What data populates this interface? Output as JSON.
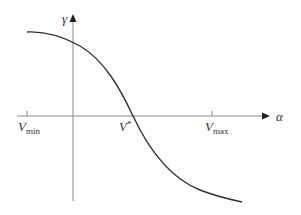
{
  "diagram": {
    "axes": {
      "x_label": "α",
      "y_label": "γ"
    },
    "ticks": [
      {
        "id": "vmin",
        "main": "V",
        "sub": "min"
      },
      {
        "id": "vstar",
        "main": "V",
        "sup": "*"
      },
      {
        "id": "vmax",
        "main": "V",
        "sub": "max"
      }
    ],
    "curve": {
      "description": "Decreasing S-shaped curve: flat near top-left, crosses horizontal axis at V*, decreasing toward bottom-right",
      "color": "#333333"
    },
    "colors": {
      "axis": "#888888",
      "curve": "#333333",
      "text": "#333333",
      "background": "#ffffff"
    }
  }
}
